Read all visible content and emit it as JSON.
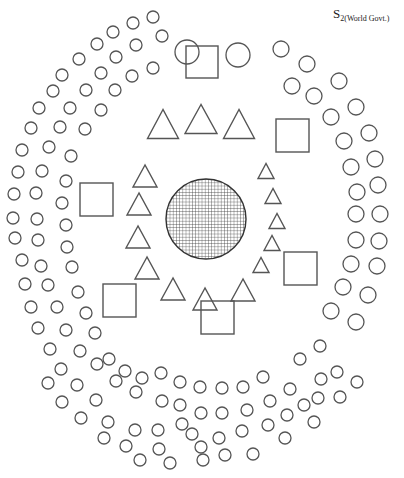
{
  "label": {
    "main": "S",
    "subscript": "2(World Govt.)"
  },
  "colors": {
    "stroke": "#555555",
    "background": "#ffffff"
  },
  "center": {
    "type": "hatched-circle",
    "cx": 206,
    "cy": 219,
    "r": 40,
    "grid_spacing": 3.2
  },
  "squares": [
    {
      "x": 186,
      "y": 46,
      "size": 32
    },
    {
      "x": 276,
      "y": 119,
      "size": 33
    },
    {
      "x": 80,
      "y": 183,
      "size": 33
    },
    {
      "x": 284,
      "y": 252,
      "size": 33
    },
    {
      "x": 103,
      "y": 284,
      "size": 33
    },
    {
      "x": 201,
      "y": 301,
      "size": 33
    }
  ],
  "large_circles": [
    {
      "cx": 187,
      "cy": 52,
      "r": 12
    },
    {
      "cx": 238,
      "cy": 55,
      "r": 12
    }
  ],
  "triangles": [
    {
      "cx": 163,
      "cy": 124,
      "w": 31,
      "h": 29
    },
    {
      "cx": 201,
      "cy": 119,
      "w": 32,
      "h": 29
    },
    {
      "cx": 239,
      "cy": 124,
      "w": 31,
      "h": 29
    },
    {
      "cx": 145,
      "cy": 176,
      "w": 24,
      "h": 22
    },
    {
      "cx": 139,
      "cy": 204,
      "w": 24,
      "h": 22
    },
    {
      "cx": 138,
      "cy": 237,
      "w": 24,
      "h": 22
    },
    {
      "cx": 147,
      "cy": 268,
      "w": 24,
      "h": 22
    },
    {
      "cx": 173,
      "cy": 289,
      "w": 24,
      "h": 22
    },
    {
      "cx": 205,
      "cy": 299,
      "w": 24,
      "h": 22
    },
    {
      "cx": 243,
      "cy": 290,
      "w": 24,
      "h": 22
    },
    {
      "cx": 261,
      "cy": 265,
      "w": 16,
      "h": 15
    },
    {
      "cx": 272,
      "cy": 243,
      "w": 16,
      "h": 15
    },
    {
      "cx": 277,
      "cy": 221,
      "w": 16,
      "h": 15
    },
    {
      "cx": 273,
      "cy": 196,
      "w": 16,
      "h": 15
    },
    {
      "cx": 266,
      "cy": 171,
      "w": 16,
      "h": 15
    }
  ],
  "medium_circles": [
    {
      "cx": 281,
      "cy": 49
    },
    {
      "cx": 307,
      "cy": 64
    },
    {
      "cx": 339,
      "cy": 81
    },
    {
      "cx": 292,
      "cy": 86
    },
    {
      "cx": 314,
      "cy": 96
    },
    {
      "cx": 356,
      "cy": 107
    },
    {
      "cx": 331,
      "cy": 117
    },
    {
      "cx": 369,
      "cy": 133
    },
    {
      "cx": 344,
      "cy": 141
    },
    {
      "cx": 375,
      "cy": 159
    },
    {
      "cx": 351,
      "cy": 167
    },
    {
      "cx": 378,
      "cy": 185
    },
    {
      "cx": 357,
      "cy": 192
    },
    {
      "cx": 380,
      "cy": 214
    },
    {
      "cx": 356,
      "cy": 214
    },
    {
      "cx": 379,
      "cy": 241
    },
    {
      "cx": 356,
      "cy": 240
    },
    {
      "cx": 377,
      "cy": 266
    },
    {
      "cx": 351,
      "cy": 264
    },
    {
      "cx": 368,
      "cy": 295
    },
    {
      "cx": 343,
      "cy": 287
    },
    {
      "cx": 356,
      "cy": 322
    },
    {
      "cx": 331,
      "cy": 311
    }
  ],
  "small_circles": [
    {
      "cx": 153,
      "cy": 17
    },
    {
      "cx": 133,
      "cy": 23
    },
    {
      "cx": 113,
      "cy": 32
    },
    {
      "cx": 162,
      "cy": 36
    },
    {
      "cx": 97,
      "cy": 44
    },
    {
      "cx": 136,
      "cy": 45
    },
    {
      "cx": 79,
      "cy": 59
    },
    {
      "cx": 116,
      "cy": 57
    },
    {
      "cx": 153,
      "cy": 68
    },
    {
      "cx": 62,
      "cy": 75
    },
    {
      "cx": 101,
      "cy": 73
    },
    {
      "cx": 132,
      "cy": 76
    },
    {
      "cx": 53,
      "cy": 91
    },
    {
      "cx": 86,
      "cy": 90
    },
    {
      "cx": 115,
      "cy": 90
    },
    {
      "cx": 39,
      "cy": 108
    },
    {
      "cx": 70,
      "cy": 108
    },
    {
      "cx": 101,
      "cy": 110
    },
    {
      "cx": 31,
      "cy": 128
    },
    {
      "cx": 60,
      "cy": 127
    },
    {
      "cx": 85,
      "cy": 129
    },
    {
      "cx": 22,
      "cy": 150
    },
    {
      "cx": 49,
      "cy": 147
    },
    {
      "cx": 71,
      "cy": 156
    },
    {
      "cx": 18,
      "cy": 172
    },
    {
      "cx": 42,
      "cy": 171
    },
    {
      "cx": 66,
      "cy": 181
    },
    {
      "cx": 14,
      "cy": 194
    },
    {
      "cx": 36,
      "cy": 193
    },
    {
      "cx": 62,
      "cy": 203
    },
    {
      "cx": 13,
      "cy": 218
    },
    {
      "cx": 37,
      "cy": 219
    },
    {
      "cx": 66,
      "cy": 225
    },
    {
      "cx": 15,
      "cy": 238
    },
    {
      "cx": 38,
      "cy": 240
    },
    {
      "cx": 67,
      "cy": 247
    },
    {
      "cx": 22,
      "cy": 260
    },
    {
      "cx": 41,
      "cy": 266
    },
    {
      "cx": 72,
      "cy": 267
    },
    {
      "cx": 25,
      "cy": 284
    },
    {
      "cx": 48,
      "cy": 285
    },
    {
      "cx": 78,
      "cy": 292
    },
    {
      "cx": 31,
      "cy": 307
    },
    {
      "cx": 57,
      "cy": 307
    },
    {
      "cx": 86,
      "cy": 313
    },
    {
      "cx": 38,
      "cy": 328
    },
    {
      "cx": 66,
      "cy": 330
    },
    {
      "cx": 95,
      "cy": 333
    },
    {
      "cx": 50,
      "cy": 349
    },
    {
      "cx": 80,
      "cy": 351
    },
    {
      "cx": 109,
      "cy": 359
    },
    {
      "cx": 61,
      "cy": 369
    },
    {
      "cx": 97,
      "cy": 364
    },
    {
      "cx": 125,
      "cy": 371
    },
    {
      "cx": 48,
      "cy": 383
    },
    {
      "cx": 77,
      "cy": 385
    },
    {
      "cx": 116,
      "cy": 381
    },
    {
      "cx": 142,
      "cy": 378
    },
    {
      "cx": 161,
      "cy": 373
    },
    {
      "cx": 180,
      "cy": 382
    },
    {
      "cx": 62,
      "cy": 402
    },
    {
      "cx": 96,
      "cy": 400
    },
    {
      "cx": 136,
      "cy": 392
    },
    {
      "cx": 162,
      "cy": 401
    },
    {
      "cx": 180,
      "cy": 405
    },
    {
      "cx": 200,
      "cy": 387
    },
    {
      "cx": 222,
      "cy": 388
    },
    {
      "cx": 243,
      "cy": 387
    },
    {
      "cx": 263,
      "cy": 377
    },
    {
      "cx": 81,
      "cy": 418
    },
    {
      "cx": 108,
      "cy": 422
    },
    {
      "cx": 135,
      "cy": 430
    },
    {
      "cx": 158,
      "cy": 430
    },
    {
      "cx": 182,
      "cy": 424
    },
    {
      "cx": 201,
      "cy": 413
    },
    {
      "cx": 222,
      "cy": 413
    },
    {
      "cx": 247,
      "cy": 410
    },
    {
      "cx": 270,
      "cy": 401
    },
    {
      "cx": 290,
      "cy": 389
    },
    {
      "cx": 300,
      "cy": 359
    },
    {
      "cx": 320,
      "cy": 346
    },
    {
      "cx": 104,
      "cy": 438
    },
    {
      "cx": 126,
      "cy": 446
    },
    {
      "cx": 159,
      "cy": 449
    },
    {
      "cx": 192,
      "cy": 434
    },
    {
      "cx": 201,
      "cy": 447
    },
    {
      "cx": 219,
      "cy": 438
    },
    {
      "cx": 242,
      "cy": 431
    },
    {
      "cx": 268,
      "cy": 425
    },
    {
      "cx": 287,
      "cy": 415
    },
    {
      "cx": 304,
      "cy": 405
    },
    {
      "cx": 321,
      "cy": 379
    },
    {
      "cx": 337,
      "cy": 372
    },
    {
      "cx": 140,
      "cy": 460
    },
    {
      "cx": 170,
      "cy": 463
    },
    {
      "cx": 203,
      "cy": 460
    },
    {
      "cx": 225,
      "cy": 455
    },
    {
      "cx": 253,
      "cy": 454
    },
    {
      "cx": 285,
      "cy": 438
    },
    {
      "cx": 318,
      "cy": 398
    },
    {
      "cx": 340,
      "cy": 397
    },
    {
      "cx": 357,
      "cy": 382
    },
    {
      "cx": 314,
      "cy": 422
    }
  ]
}
